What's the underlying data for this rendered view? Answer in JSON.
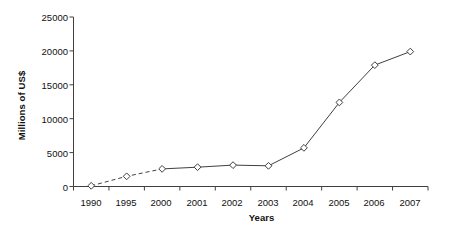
{
  "chart_data": {
    "type": "line",
    "title": "",
    "xlabel": "Years",
    "ylabel": "Millions of US$",
    "categories": [
      "1990",
      "1995",
      "2000",
      "2001",
      "2002",
      "2003",
      "2004",
      "2005",
      "2006",
      "2007"
    ],
    "values": [
      100,
      1500,
      2600,
      2850,
      3150,
      3050,
      5700,
      12400,
      17900,
      19900
    ],
    "series": [
      {
        "name": "Millions of US$",
        "values": [
          100,
          1500,
          2600,
          2850,
          3150,
          3050,
          5700,
          12400,
          17900,
          19900
        ]
      }
    ],
    "ylim": [
      0,
      25000
    ],
    "y_ticks": [
      0,
      5000,
      10000,
      15000,
      20000,
      25000
    ],
    "y_tick_labels": [
      "0",
      "5000",
      "10000",
      "15000",
      "20000",
      "25000"
    ],
    "x_tick_labels": [
      "1990",
      "1995",
      "2000",
      "2001",
      "2002",
      "2003",
      "2004",
      "2005",
      "2006",
      "2007"
    ],
    "grid": false,
    "legend": false,
    "legend_position": "none",
    "marker": "diamond-open",
    "line_segments": [
      {
        "from": "1990",
        "to": "2000",
        "style": "dashed"
      },
      {
        "from": "2000",
        "to": "2007",
        "style": "solid"
      }
    ],
    "colors": {
      "line": "#404040",
      "marker_stroke": "#404040",
      "marker_fill": "#ffffff",
      "axis": "#404040",
      "text": "#111111",
      "background": "#ffffff"
    }
  }
}
